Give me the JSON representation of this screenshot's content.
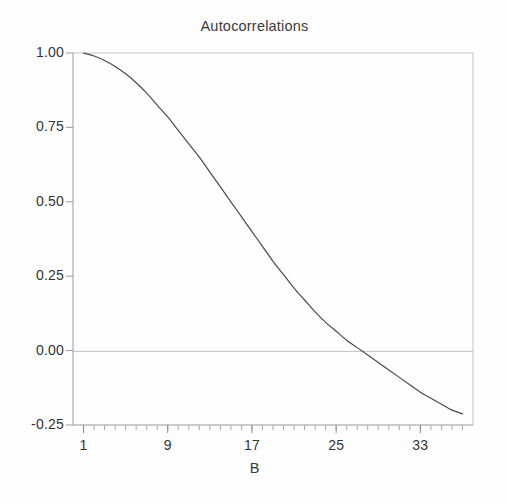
{
  "figure": {
    "background_color": "#fefefe",
    "title": "Autocorrelations",
    "axis_color": "#b9b9b9",
    "text_color": "#333333"
  },
  "chart_data": {
    "type": "line",
    "title": "Autocorrelations",
    "xlabel": "B",
    "ylabel": "",
    "xlim": [
      0,
      38
    ],
    "ylim": [
      -0.25,
      1.0
    ],
    "grid": false,
    "legend": null,
    "zero_line": 0.0,
    "line_color": "#4a4a4a",
    "line_width": 1.2,
    "xticks": [
      1,
      9,
      17,
      25,
      33
    ],
    "xtick_labels": [
      "1",
      "9",
      "17",
      "25",
      "33"
    ],
    "xminor_tick_step": 1,
    "yticks": [
      -0.25,
      0.0,
      0.25,
      0.5,
      0.75,
      1.0
    ],
    "ytick_labels": [
      "-0.25",
      "0.00",
      "0.25",
      "0.50",
      "0.75",
      "1.00"
    ],
    "series": [
      {
        "name": "autocorrelation",
        "x": [
          1,
          2,
          3,
          4,
          5,
          6,
          7,
          8,
          9,
          10,
          11,
          12,
          13,
          14,
          15,
          16,
          17,
          18,
          19,
          20,
          21,
          22,
          23,
          24,
          25,
          26,
          27,
          28,
          29,
          30,
          31,
          32,
          33,
          34,
          35,
          36,
          37
        ],
        "values": [
          1.0,
          0.99,
          0.975,
          0.955,
          0.93,
          0.9,
          0.865,
          0.825,
          0.785,
          0.74,
          0.695,
          0.65,
          0.6,
          0.55,
          0.5,
          0.45,
          0.4,
          0.35,
          0.3,
          0.255,
          0.21,
          0.17,
          0.13,
          0.095,
          0.065,
          0.035,
          0.01,
          -0.015,
          -0.04,
          -0.065,
          -0.09,
          -0.115,
          -0.14,
          -0.16,
          -0.18,
          -0.2,
          -0.212
        ]
      }
    ]
  }
}
